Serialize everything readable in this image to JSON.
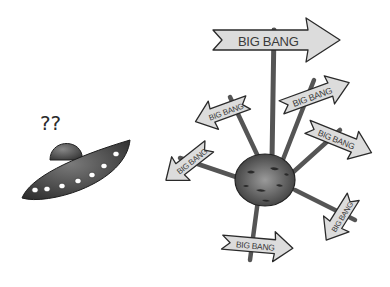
{
  "scene": {
    "description": "Cartoon of a confused UFO looking at a planet with many BIG BANG arrow signs pointing in all directions",
    "ufo": {
      "label": "?? ",
      "question_marks": "??",
      "window_count": 7
    },
    "planet": {
      "signs": [
        {
          "id": "top",
          "text": "BIG BANG"
        },
        {
          "id": "upper-right",
          "text": "BIG BANG"
        },
        {
          "id": "upper-left",
          "text": "BIG BANG"
        },
        {
          "id": "right",
          "text": "BIG BANG"
        },
        {
          "id": "left",
          "text": "BIG BANG"
        },
        {
          "id": "lower-right",
          "text": "BIG BANG"
        },
        {
          "id": "bottom",
          "text": "BIG BANG"
        }
      ]
    },
    "colors": {
      "background": "#ffffff",
      "ufo_body": "#3c3c3c",
      "ufo_dome": "#555555",
      "sign_fill": "#dcdcdc",
      "sign_stroke": "#2a2a2a",
      "pole": "#4a4a4a",
      "planet": "#5a5a5a"
    }
  }
}
